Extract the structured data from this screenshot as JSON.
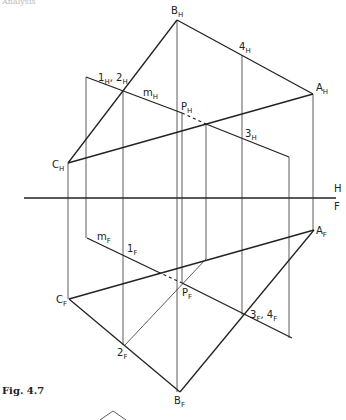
{
  "header_fragment": "Analysis",
  "caption": "Fig. 4.7",
  "reference_line": {
    "upper_label": "H",
    "lower_label": "F"
  },
  "points_top_view": {
    "A": {
      "base": "A",
      "sub": "H"
    },
    "B": {
      "base": "B",
      "sub": "H"
    },
    "C": {
      "base": "C",
      "sub": "H"
    },
    "P": {
      "base": "P",
      "sub": "H"
    },
    "m": {
      "base": "m",
      "sub": "H"
    },
    "one_two": {
      "base1": "1",
      "sub1": "H",
      "sep": ", ",
      "base2": "2",
      "sub2": "H"
    },
    "three": {
      "base": "3",
      "sub": "H"
    },
    "four": {
      "base": "4",
      "sub": "H"
    }
  },
  "points_front_view": {
    "A": {
      "base": "A",
      "sub": "F"
    },
    "B": {
      "base": "B",
      "sub": "F"
    },
    "C": {
      "base": "C",
      "sub": "F"
    },
    "P": {
      "base": "P",
      "sub": "F"
    },
    "m": {
      "base": "m",
      "sub": "F"
    },
    "one": {
      "base": "1",
      "sub": "F"
    },
    "two": {
      "base": "2",
      "sub": "F"
    },
    "three_four": {
      "base1": "3",
      "sub1": "F",
      "sep": ", ",
      "base2": "4",
      "sub2": "F"
    }
  }
}
